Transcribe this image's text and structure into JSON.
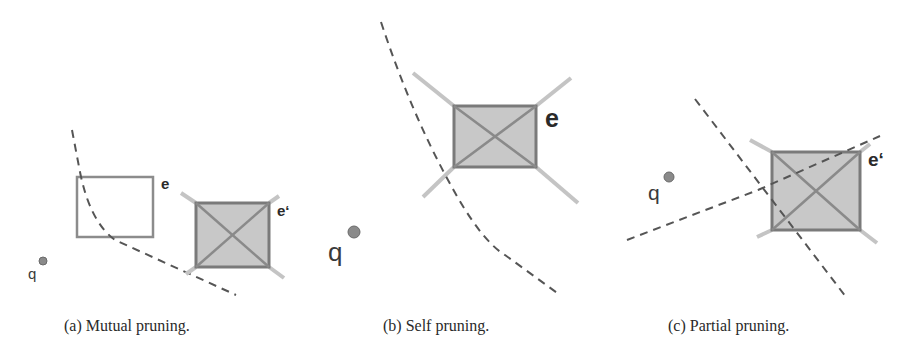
{
  "figure": {
    "panels": [
      {
        "id": "a",
        "caption": "(a) Mutual pruning.",
        "query_label": "q",
        "entry_label": "e",
        "pruned_entry_label": "e‘"
      },
      {
        "id": "b",
        "caption": "(b) Self pruning.",
        "query_label": "q",
        "entry_label": "e"
      },
      {
        "id": "c",
        "caption": "(c) Partial pruning.",
        "query_label": "q",
        "pruned_entry_label": "e‘"
      }
    ],
    "colors": {
      "dashed_line": "#555555",
      "box_fill": "#c8c8c8",
      "box_stroke": "#7a7a7a",
      "extension_line": "#c4c4c4",
      "query_point": "#8a8a8a"
    }
  }
}
